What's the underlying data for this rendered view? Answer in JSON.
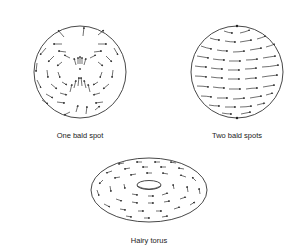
{
  "figures": [
    {
      "id": "sphere-one-bald-spot",
      "label": "One bald spot"
    },
    {
      "id": "sphere-two-bald-spots",
      "label": "Two bald spots"
    },
    {
      "id": "hairy-torus",
      "label": "Hairy torus"
    }
  ],
  "colors": {
    "stroke": "#333333",
    "background": "#ffffff"
  }
}
